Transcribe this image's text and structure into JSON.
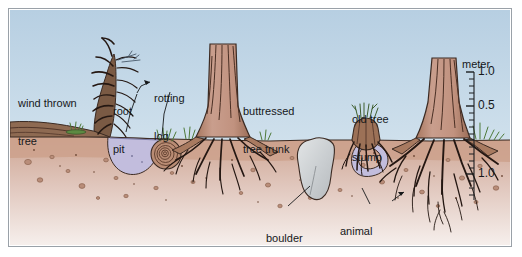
{
  "figure": {
    "kind": "cross-section illustration",
    "background_sky_color": "#c4d9e8",
    "soil_upper_color": "#cfa893",
    "soil_lower_color": "#efe1dd",
    "water_pit_color": "#c3bedd",
    "wood_color": "#c49a8c",
    "wood_dark": "#4a2f24",
    "boulder_color": "#cfd3d4",
    "grass_color": "#4e7a3a",
    "frame_color": "#9aa1a8"
  },
  "labels": [
    {
      "id": "wind-thrown-tree",
      "line1": "wind thrown",
      "line2": "tree"
    },
    {
      "id": "root-pit",
      "line1": "root",
      "line2": "pit"
    },
    {
      "id": "rotting-log",
      "line1": "rotting",
      "line2": "log"
    },
    {
      "id": "buttressed-tree-trunk",
      "line1": "buttressed",
      "line2": "tree trunk"
    },
    {
      "id": "old-tree-stump",
      "line1": "old tree",
      "line2": "stump"
    },
    {
      "id": "boulder",
      "line1": "boulder",
      "line2": ""
    },
    {
      "id": "animal-burrow",
      "line1": "animal",
      "line2": "burrow"
    }
  ],
  "scale": {
    "title": "meter",
    "ticks_above_ground": [
      "1.0",
      "0.5"
    ],
    "ticks_below_ground": [
      "1.0"
    ],
    "minor_ticks_count": 10,
    "ground_level_value": "0"
  },
  "features": [
    {
      "name": "wind thrown tree",
      "position": "left",
      "type": "fallen trunk with upturned root plate"
    },
    {
      "name": "root pit",
      "position": "left-center",
      "type": "water filled depression"
    },
    {
      "name": "rotting log",
      "position": "center-left",
      "type": "log cross-section with growth rings"
    },
    {
      "name": "buttressed tree trunk",
      "position": "center",
      "type": "standing trunk with buttress roots"
    },
    {
      "name": "boulder",
      "position": "center-right",
      "type": "buried rock"
    },
    {
      "name": "old tree stump",
      "position": "right-center",
      "type": "decaying stump with sprouts"
    },
    {
      "name": "animal burrow",
      "position": "right-center",
      "type": "subsurface tunnel"
    },
    {
      "name": "live tree",
      "position": "right",
      "type": "trunk with deep root system"
    }
  ]
}
